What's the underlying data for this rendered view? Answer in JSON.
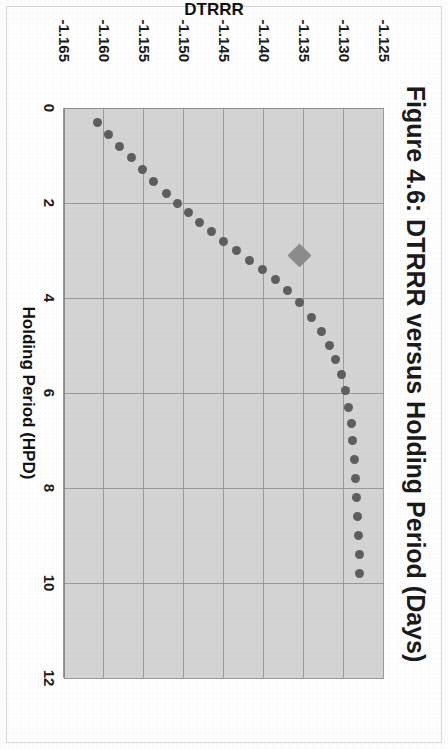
{
  "figure": {
    "title": "Figure 4.6: DTRRR versus Holding Period (Days)",
    "y_axis_title": "DTRRR",
    "x_axis_title": "Holding Period (HPD)"
  },
  "colors": {
    "plot_background": "#d4d4d4",
    "gridline": "#9a9a9a",
    "marker": "#5e5e5e",
    "highlight_marker": "#8c8c8c",
    "text": "#1a1a1a",
    "page_background": "#ffffff"
  },
  "chart_data": {
    "type": "scatter",
    "title": "Figure 4.6: DTRRR versus Holding Period (Days)",
    "xlabel": "Holding Period (HPD)",
    "ylabel": "DTRRR",
    "xlim": [
      0,
      12
    ],
    "ylim": [
      -1.165,
      -1.125
    ],
    "y_axis_inverted": true,
    "grid": true,
    "legend": "none",
    "xticks": [
      0,
      2,
      4,
      6,
      8,
      10,
      12
    ],
    "yticks": [
      -1.125,
      -1.13,
      -1.135,
      -1.14,
      -1.145,
      -1.15,
      -1.155,
      -1.16,
      -1.165
    ],
    "xtick_labels": [
      "0",
      "2",
      "4",
      "6",
      "8",
      "10",
      "12"
    ],
    "ytick_labels": [
      "-1.125",
      "-1.130",
      "-1.135",
      "-1.140",
      "-1.145",
      "-1.150",
      "-1.155",
      "-1.160",
      "-1.165"
    ],
    "series": [
      {
        "name": "DTRRR",
        "marker": "circle",
        "x": [
          0.3,
          0.55,
          0.8,
          1.05,
          1.3,
          1.55,
          1.8,
          2.0,
          2.2,
          2.4,
          2.6,
          2.8,
          3.0,
          3.2,
          3.4,
          3.6,
          3.85,
          4.1,
          4.4,
          4.7,
          5.0,
          5.3,
          5.6,
          5.95,
          6.3,
          6.65,
          7.0,
          7.4,
          7.8,
          8.2,
          8.6,
          9.0,
          9.4,
          9.8
        ],
        "y": [
          -1.1608,
          -1.1594,
          -1.158,
          -1.1566,
          -1.1552,
          -1.1538,
          -1.1522,
          -1.1508,
          -1.1494,
          -1.148,
          -1.1466,
          -1.145,
          -1.1434,
          -1.1418,
          -1.1402,
          -1.1386,
          -1.137,
          -1.1355,
          -1.134,
          -1.1328,
          -1.1318,
          -1.131,
          -1.1303,
          -1.1298,
          -1.1294,
          -1.1291,
          -1.1289,
          -1.1287,
          -1.1285,
          -1.1284,
          -1.1283,
          -1.1282,
          -1.1281,
          -1.128
        ]
      },
      {
        "name": "Selected point",
        "marker": "diamond",
        "highlight": true,
        "x": [
          3.1
        ],
        "y": [
          -1.1355
        ]
      }
    ]
  }
}
